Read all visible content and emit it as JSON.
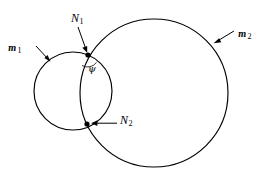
{
  "figure": {
    "type": "geometric-line-diagram",
    "background_color": "#ffffff",
    "stroke_color": "#000000"
  },
  "labels": {
    "curve1": {
      "symbol": "m",
      "subscript": "1"
    },
    "curve2": {
      "symbol": "m",
      "subscript": "2"
    },
    "node1": {
      "symbol": "N",
      "subscript": "1"
    },
    "node2": {
      "symbol": "N",
      "subscript": "2"
    },
    "angle": {
      "symbol": "ψ"
    }
  },
  "geometry": {
    "circle1": {
      "cx": 73,
      "cy": 91,
      "r": 39
    },
    "circle2": {
      "cx": 154,
      "cy": 93,
      "r": 74
    },
    "node1_point": {
      "x": 88,
      "y": 55
    },
    "node2_point": {
      "x": 87,
      "y": 124
    },
    "node_dot_radius": 2.6,
    "angle_arc": {
      "cx": 88,
      "cy": 55,
      "r": 11
    },
    "leader_m1": {
      "x1": 36,
      "y1": 46,
      "x2": 50,
      "y2": 61
    },
    "leader_m2": {
      "x1": 234,
      "y1": 31,
      "x2": 214,
      "y2": 43
    },
    "leader_N1": {
      "x1": 78,
      "y1": 27,
      "x2": 87,
      "y2": 52
    },
    "leader_N2": {
      "x1": 117,
      "y1": 123,
      "x2": 92,
      "y2": 123
    }
  }
}
